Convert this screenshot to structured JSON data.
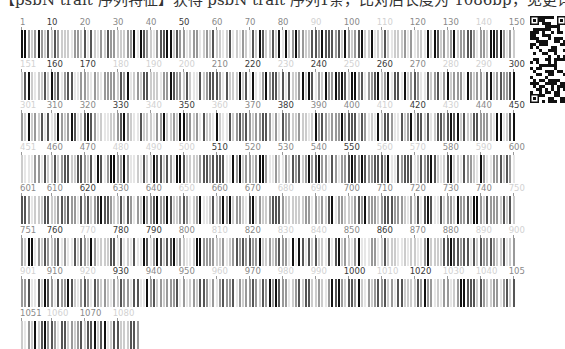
{
  "header": {
    "text": "【psbN trait 序列特征】获得 psbN trait 序列1条，比对后长度为 1086bp，见更详细信息，可扫描二维码"
  },
  "qr_code": {
    "icon": "qr-code-icon",
    "x": 530,
    "y": 16,
    "width": 36,
    "height": 87
  },
  "barcode": {
    "sequence_length": 1086,
    "bases_per_row": 150,
    "row_start_x": 21,
    "bar_pitch": 3.3,
    "row_top_first": 18,
    "row_pitch": 41.5,
    "label_height": 10,
    "bar_height": 28,
    "shades": {
      "dark": "#3a3a3a",
      "mid": "#8a8a8a",
      "faint": "#d2d2d2"
    },
    "bar_colors": [
      "#111111",
      "#555555",
      "#999999",
      "#cccccc",
      "#e6e6e6"
    ],
    "rows": [
      {
        "start": 1,
        "end": 150,
        "labels": [
          {
            "t": "1",
            "s": "mid"
          },
          {
            "t": "10",
            "s": "dark"
          },
          {
            "t": "20",
            "s": "mid"
          },
          {
            "t": "30",
            "s": "mid"
          },
          {
            "t": "40",
            "s": "mid"
          },
          {
            "t": "50",
            "s": "dark"
          },
          {
            "t": "60",
            "s": "mid"
          },
          {
            "t": "70",
            "s": "mid"
          },
          {
            "t": "80",
            "s": "mid"
          },
          {
            "t": "90",
            "s": "faint"
          },
          {
            "t": "100",
            "s": "mid"
          },
          {
            "t": "110",
            "s": "faint"
          },
          {
            "t": "120",
            "s": "mid"
          },
          {
            "t": "130",
            "s": "mid"
          },
          {
            "t": "140",
            "s": "faint"
          },
          {
            "t": "150",
            "s": "mid"
          }
        ]
      },
      {
        "start": 151,
        "end": 300,
        "labels": [
          {
            "t": "151",
            "s": "faint"
          },
          {
            "t": "160",
            "s": "dark"
          },
          {
            "t": "170",
            "s": "dark"
          },
          {
            "t": "180",
            "s": "faint"
          },
          {
            "t": "190",
            "s": "faint"
          },
          {
            "t": "200",
            "s": "faint"
          },
          {
            "t": "210",
            "s": "mid"
          },
          {
            "t": "220",
            "s": "dark"
          },
          {
            "t": "230",
            "s": "faint"
          },
          {
            "t": "240",
            "s": "dark"
          },
          {
            "t": "250",
            "s": "faint"
          },
          {
            "t": "260",
            "s": "dark"
          },
          {
            "t": "270",
            "s": "mid"
          },
          {
            "t": "280",
            "s": "faint"
          },
          {
            "t": "290",
            "s": "faint"
          },
          {
            "t": "300",
            "s": "dark"
          }
        ]
      },
      {
        "start": 301,
        "end": 450,
        "labels": [
          {
            "t": "301",
            "s": "faint"
          },
          {
            "t": "310",
            "s": "mid"
          },
          {
            "t": "320",
            "s": "mid"
          },
          {
            "t": "330",
            "s": "dark"
          },
          {
            "t": "340",
            "s": "faint"
          },
          {
            "t": "350",
            "s": "dark"
          },
          {
            "t": "360",
            "s": "faint"
          },
          {
            "t": "370",
            "s": "mid"
          },
          {
            "t": "380",
            "s": "dark"
          },
          {
            "t": "390",
            "s": "mid"
          },
          {
            "t": "400",
            "s": "mid"
          },
          {
            "t": "410",
            "s": "faint"
          },
          {
            "t": "420",
            "s": "dark"
          },
          {
            "t": "430",
            "s": "faint"
          },
          {
            "t": "440",
            "s": "mid"
          },
          {
            "t": "450",
            "s": "dark"
          }
        ]
      },
      {
        "start": 451,
        "end": 600,
        "labels": [
          {
            "t": "451",
            "s": "faint"
          },
          {
            "t": "460",
            "s": "mid"
          },
          {
            "t": "470",
            "s": "mid"
          },
          {
            "t": "480",
            "s": "faint"
          },
          {
            "t": "490",
            "s": "faint"
          },
          {
            "t": "500",
            "s": "faint"
          },
          {
            "t": "510",
            "s": "dark"
          },
          {
            "t": "520",
            "s": "mid"
          },
          {
            "t": "530",
            "s": "mid"
          },
          {
            "t": "540",
            "s": "mid"
          },
          {
            "t": "550",
            "s": "dark"
          },
          {
            "t": "560",
            "s": "faint"
          },
          {
            "t": "570",
            "s": "faint"
          },
          {
            "t": "580",
            "s": "mid"
          },
          {
            "t": "590",
            "s": "faint"
          },
          {
            "t": "600",
            "s": "mid"
          }
        ]
      },
      {
        "start": 601,
        "end": 750,
        "labels": [
          {
            "t": "601",
            "s": "mid"
          },
          {
            "t": "610",
            "s": "mid"
          },
          {
            "t": "620",
            "s": "dark"
          },
          {
            "t": "630",
            "s": "mid"
          },
          {
            "t": "640",
            "s": "mid"
          },
          {
            "t": "650",
            "s": "faint"
          },
          {
            "t": "660",
            "s": "mid"
          },
          {
            "t": "670",
            "s": "mid"
          },
          {
            "t": "680",
            "s": "faint"
          },
          {
            "t": "690",
            "s": "faint"
          },
          {
            "t": "700",
            "s": "mid"
          },
          {
            "t": "710",
            "s": "mid"
          },
          {
            "t": "720",
            "s": "mid"
          },
          {
            "t": "730",
            "s": "mid"
          },
          {
            "t": "740",
            "s": "mid"
          },
          {
            "t": "750",
            "s": "faint"
          }
        ]
      },
      {
        "start": 751,
        "end": 900,
        "labels": [
          {
            "t": "751",
            "s": "mid"
          },
          {
            "t": "760",
            "s": "dark"
          },
          {
            "t": "770",
            "s": "faint"
          },
          {
            "t": "780",
            "s": "dark"
          },
          {
            "t": "790",
            "s": "dark"
          },
          {
            "t": "800",
            "s": "mid"
          },
          {
            "t": "810",
            "s": "faint"
          },
          {
            "t": "820",
            "s": "mid"
          },
          {
            "t": "830",
            "s": "faint"
          },
          {
            "t": "840",
            "s": "faint"
          },
          {
            "t": "850",
            "s": "mid"
          },
          {
            "t": "860",
            "s": "dark"
          },
          {
            "t": "870",
            "s": "mid"
          },
          {
            "t": "880",
            "s": "mid"
          },
          {
            "t": "890",
            "s": "faint"
          },
          {
            "t": "900",
            "s": "faint"
          }
        ]
      },
      {
        "start": 901,
        "end": 1050,
        "labels": [
          {
            "t": "901",
            "s": "faint"
          },
          {
            "t": "910",
            "s": "mid"
          },
          {
            "t": "920",
            "s": "faint"
          },
          {
            "t": "930",
            "s": "dark"
          },
          {
            "t": "940",
            "s": "mid"
          },
          {
            "t": "950",
            "s": "mid"
          },
          {
            "t": "960",
            "s": "faint"
          },
          {
            "t": "970",
            "s": "mid"
          },
          {
            "t": "980",
            "s": "faint"
          },
          {
            "t": "990",
            "s": "faint"
          },
          {
            "t": "1000",
            "s": "dark"
          },
          {
            "t": "1010",
            "s": "faint"
          },
          {
            "t": "1020",
            "s": "dark"
          },
          {
            "t": "1030",
            "s": "faint"
          },
          {
            "t": "1040",
            "s": "faint"
          },
          {
            "t": "105",
            "s": "mid"
          }
        ]
      },
      {
        "start": 1051,
        "end": 1086,
        "labels": [
          {
            "t": "1051",
            "s": "mid"
          },
          {
            "t": "1060",
            "s": "faint"
          },
          {
            "t": "1070",
            "s": "mid"
          },
          {
            "t": "1080",
            "s": "faint"
          }
        ]
      }
    ]
  }
}
